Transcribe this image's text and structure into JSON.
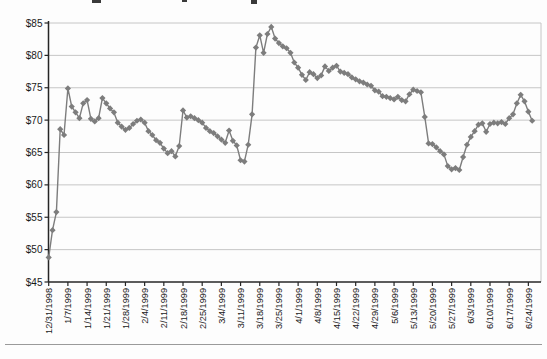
{
  "chart_data": {
    "type": "line",
    "title": "",
    "xlabel": "",
    "ylabel": "",
    "ylim": [
      45,
      85
    ],
    "y_tick_step": 5,
    "y_tick_labels": [
      "$85",
      "$80",
      "$75",
      "$70",
      "$65",
      "$60",
      "$55",
      "$50",
      "$45"
    ],
    "x_tick_labels": [
      "12/31/1998",
      "1/7/1999",
      "1/14/1999",
      "1/21/1999",
      "1/28/1999",
      "2/4/1999",
      "2/11/1999",
      "2/18/1999",
      "2/25/1999",
      "3/4/1999",
      "3/11/1999",
      "3/18/1999",
      "3/25/1999",
      "4/1/1999",
      "4/8/1999",
      "4/15/1999",
      "4/22/1999",
      "4/29/1999",
      "5/6/1999",
      "5/13/1999",
      "5/20/1999",
      "5/27/1999",
      "6/3/1999",
      "6/10/1999",
      "6/17/1999",
      "6/24/1999"
    ],
    "x_tick_every_n_points": 5,
    "grid": "horizontal",
    "legend": "none",
    "marker": "diamond",
    "series_color": "#7d7d7d",
    "grid_color": "#c6c6c6",
    "axis_color": "#262626",
    "text_color": "#1a1a1a",
    "series": [
      {
        "values": [
          48.8,
          53.0,
          55.8,
          68.6,
          67.7,
          74.9,
          72.1,
          71.2,
          70.3,
          72.6,
          73.1,
          70.2,
          69.8,
          70.3,
          73.4,
          72.6,
          71.8,
          71.2,
          69.6,
          69.0,
          68.5,
          68.8,
          69.4,
          69.9,
          70.1,
          69.6,
          68.3,
          67.7,
          66.9,
          66.5,
          65.6,
          64.9,
          65.2,
          64.4,
          66.0,
          71.5,
          70.4,
          70.6,
          70.3,
          70.0,
          69.6,
          68.8,
          68.3,
          68.0,
          67.5,
          67.0,
          66.5,
          68.4,
          66.8,
          66.1,
          63.8,
          63.6,
          66.2,
          70.9,
          81.2,
          83.1,
          80.4,
          83.3,
          84.4,
          82.6,
          81.9,
          81.4,
          81.1,
          80.4,
          78.9,
          78.1,
          77.0,
          76.2,
          77.4,
          77.1,
          76.5,
          76.9,
          78.3,
          77.6,
          78.1,
          78.4,
          77.5,
          77.3,
          77.1,
          76.6,
          76.3,
          76.0,
          75.8,
          75.5,
          75.3,
          74.6,
          74.4,
          73.7,
          73.6,
          73.4,
          73.2,
          73.6,
          73.1,
          72.9,
          74.0,
          74.7,
          74.5,
          74.3,
          70.5,
          66.4,
          66.3,
          65.8,
          65.2,
          64.7,
          62.9,
          62.4,
          62.6,
          62.3,
          64.3,
          66.2,
          67.4,
          68.3,
          69.3,
          69.5,
          68.2,
          69.4,
          69.6,
          69.5,
          69.7,
          69.4,
          70.3,
          70.9,
          72.6,
          73.9,
          72.9,
          71.3,
          69.9
        ]
      }
    ]
  }
}
